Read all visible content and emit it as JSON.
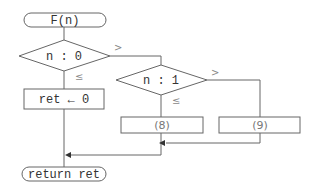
{
  "flowchart": {
    "start": {
      "label": "F(n)"
    },
    "decision1": {
      "label": "n : 0",
      "branch_right": ">",
      "branch_down": "≤"
    },
    "process1": {
      "label": "ret ← 0"
    },
    "decision2": {
      "label": "n : 1",
      "branch_right": ">",
      "branch_down": "≤"
    },
    "blank8": {
      "label": "(8)"
    },
    "blank9": {
      "label": "(9)"
    },
    "end": {
      "label": "return ret"
    }
  },
  "colors": {
    "stroke": "#666666",
    "text": "#333333",
    "arrow": "#333333"
  }
}
